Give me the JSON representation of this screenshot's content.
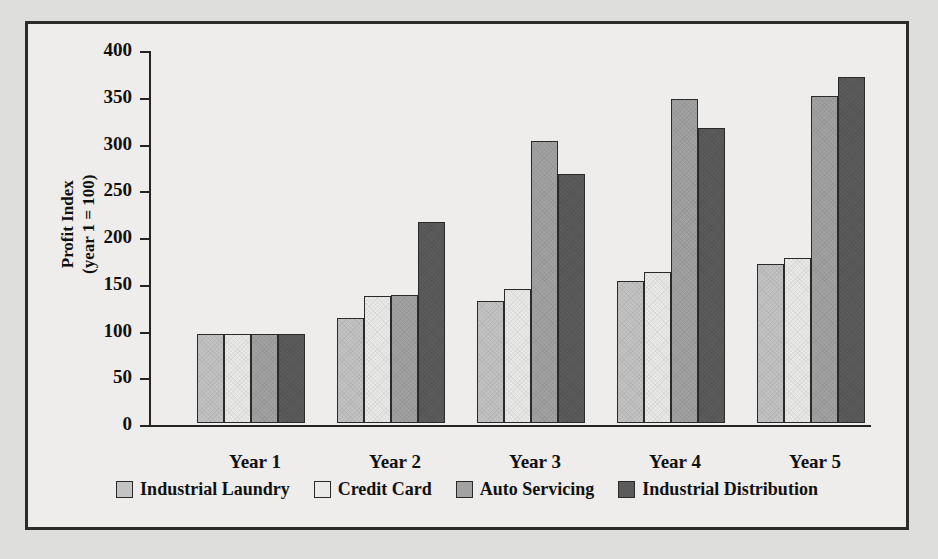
{
  "chart_data": {
    "type": "bar",
    "title": "",
    "xlabel": "",
    "ylabel": "Profit Index\n(year 1 = 100)",
    "ylabel_line1": "Profit Index",
    "ylabel_line2": "(year 1 = 100)",
    "ylim": [
      0,
      400
    ],
    "ytick_step": 50,
    "yticks": [
      "400",
      "350",
      "300",
      "250",
      "200",
      "150",
      "100",
      "50",
      "0"
    ],
    "ytick_values": [
      400,
      350,
      300,
      250,
      200,
      150,
      100,
      50,
      0
    ],
    "grid": false,
    "legend_position": "bottom",
    "categories": [
      "Year 1",
      "Year 2",
      "Year 3",
      "Year 4",
      "Year 5"
    ],
    "series": [
      {
        "name": "Industrial Laundry",
        "color": "#c3c3c3",
        "values": [
          95,
          112,
          130,
          152,
          170
        ]
      },
      {
        "name": "Credit Card",
        "color": "#eaeae8",
        "values": [
          95,
          136,
          143,
          161,
          176
        ]
      },
      {
        "name": "Auto Servicing",
        "color": "#a2a2a2",
        "values": [
          95,
          137,
          302,
          347,
          350
        ]
      },
      {
        "name": "Industrial Distribution",
        "color": "#5b5b5b",
        "values": [
          95,
          215,
          266,
          316,
          370
        ]
      }
    ]
  },
  "figure": {
    "background": "#eeedeb",
    "border_color": "#2b2b2b",
    "page_background": "#dededc"
  }
}
